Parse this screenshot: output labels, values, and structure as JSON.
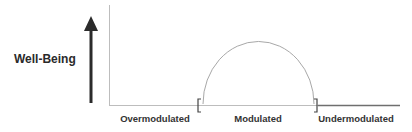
{
  "diagram": {
    "y_axis_label": "Well-Being",
    "x_labels": [
      {
        "text": "Overmodulated",
        "x": 155
      },
      {
        "text": "Modulated",
        "x": 258
      },
      {
        "text": "Undermodulated",
        "x": 356
      }
    ],
    "brackets": {
      "left": "[",
      "right": "]"
    },
    "colors": {
      "arrow": "#2b2b2b",
      "axis": "#bdbdbd",
      "curve": "#a8a8a8",
      "baseline_right": "#6f6f6f",
      "text": "#2a2a2a"
    }
  }
}
